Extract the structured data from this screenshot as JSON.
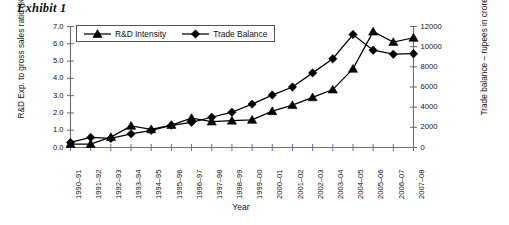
{
  "exhibit": {
    "title": "Exhibit 1"
  },
  "chart_data": {
    "type": "line",
    "title": "",
    "xlabel": "Year",
    "ylabel": "R&D Exp. to gross sales ratio (%)",
    "y2label": "Trade balance – rupees in crores",
    "grid": false,
    "legend_position": "top-left-inside",
    "ylim": [
      0.0,
      7.0
    ],
    "y2lim": [
      0,
      12000
    ],
    "yticks": [
      "0.0",
      "1.0",
      "2.0",
      "3.0",
      "4.0",
      "5.0",
      "6.0",
      "7.0"
    ],
    "y2ticks": [
      "0",
      "2000",
      "4000",
      "6000",
      "8000",
      "10000",
      "12000"
    ],
    "categories": [
      "1990–91",
      "1991–92",
      "1992–93",
      "1993–94",
      "1994–95",
      "1995–96",
      "1996–97",
      "1997–98",
      "1998–99",
      "1999–00",
      "2000–01",
      "2001–02",
      "2002–03",
      "2003–04",
      "2004–05",
      "2005–06",
      "2006–07",
      "2007–08"
    ],
    "series": [
      {
        "name": "R&D Intensity",
        "axis": "left",
        "marker": "triangle",
        "color": "#000000",
        "values": [
          0.2,
          0.2,
          0.6,
          1.25,
          1.05,
          1.3,
          1.7,
          1.5,
          1.55,
          1.6,
          2.1,
          2.45,
          2.9,
          3.35,
          4.55,
          6.7,
          6.1,
          6.35
        ]
      },
      {
        "name": "Trade Balance",
        "axis": "right",
        "marker": "diamond",
        "color": "#000000",
        "values": [
          500,
          1000,
          900,
          1350,
          1700,
          2200,
          2500,
          3000,
          3500,
          4300,
          5200,
          6000,
          7400,
          8800,
          11200,
          9650,
          9250,
          9300
        ]
      }
    ]
  }
}
